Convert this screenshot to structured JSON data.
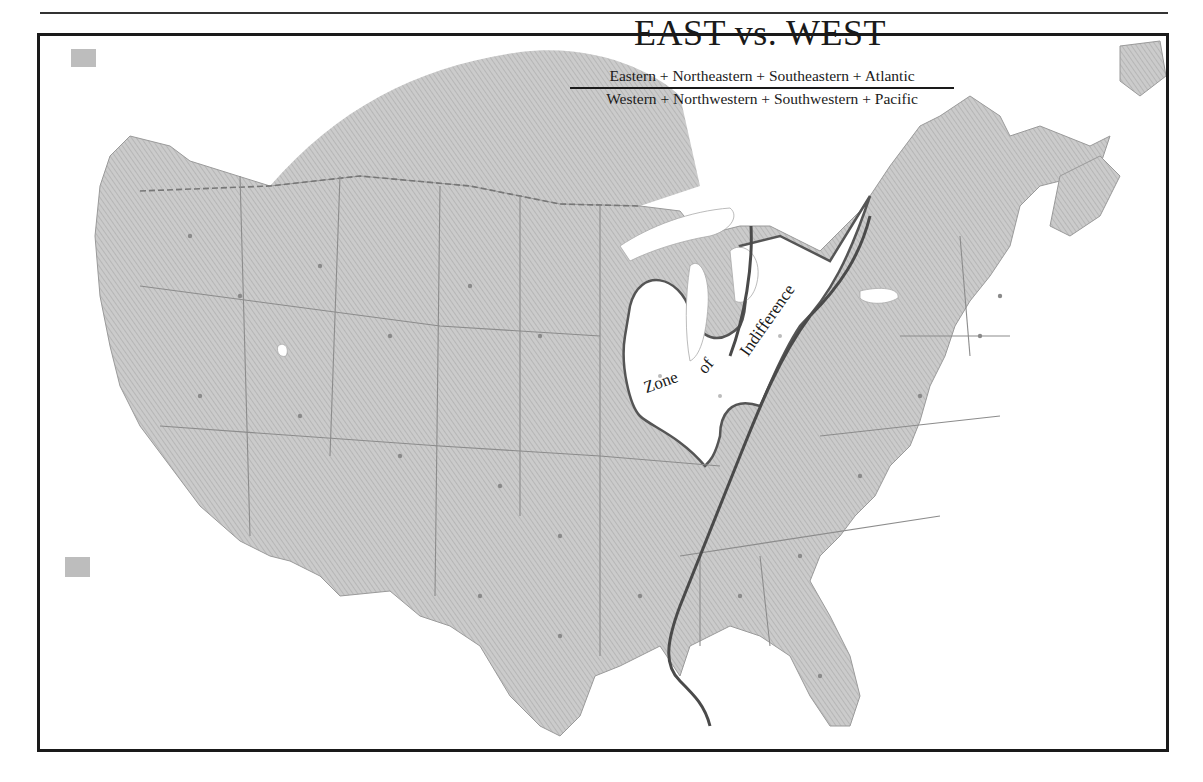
{
  "map": {
    "title": "EAST vs. WEST",
    "fraction": {
      "numerator": "Eastern + Northeastern + Southeastern + Atlantic",
      "denominator": "Western + Northwestern + Southwestern + Pacific"
    },
    "zone_label": {
      "word1": "Zone",
      "word2": "of",
      "word3": "Indifference"
    },
    "region": "Contiguous United States with adjacent Canada",
    "colors": {
      "land_fill": "#c4c4c4",
      "hatch": "#b0b0b0",
      "border": "#7a7a7a",
      "dividing_line": "#4a4a4a",
      "zone_fill": "#ffffff",
      "water": "#ffffff",
      "frame": "#1a1a1a"
    }
  }
}
